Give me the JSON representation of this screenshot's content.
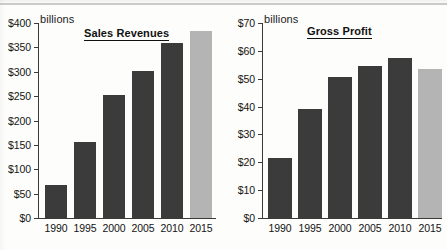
{
  "page": {
    "background_color": "#fdfdfb",
    "bar_dark_color": "#3b3b3b",
    "bar_light_color": "#b4b4b4",
    "axis_color": "#3a3a3a"
  },
  "charts": [
    {
      "id": "sales-revenues",
      "title": "Sales Revenues",
      "units_label": "billions",
      "type": "bar",
      "categories": [
        "1990",
        "1995",
        "2000",
        "2005",
        "2010",
        "2015"
      ],
      "values": [
        68,
        155,
        252,
        301,
        360,
        383
      ],
      "y_ticks": [
        "$0",
        "$50",
        "$100",
        "$150",
        "$200",
        "$250",
        "$300",
        "$350",
        "$400"
      ],
      "y_tick_values": [
        0,
        50,
        100,
        150,
        200,
        250,
        300,
        350,
        400
      ],
      "ylim": [
        0,
        400
      ],
      "xlabel": "",
      "ylabel": "billions",
      "grid": false,
      "legend": "none",
      "bar_shades": [
        "dark",
        "dark",
        "dark",
        "dark",
        "dark",
        "light"
      ]
    },
    {
      "id": "gross-profit",
      "title": "Gross Profit",
      "units_label": "billions",
      "type": "bar",
      "categories": [
        "1990",
        "1995",
        "2000",
        "2005",
        "2010",
        "2015"
      ],
      "values": [
        21.5,
        39,
        50.5,
        54.5,
        57.5,
        53.5
      ],
      "y_ticks": [
        "$0",
        "$10",
        "$20",
        "$30",
        "$40",
        "$50",
        "$60",
        "$70"
      ],
      "y_tick_values": [
        0,
        10,
        20,
        30,
        40,
        50,
        60,
        70
      ],
      "ylim": [
        0,
        70
      ],
      "xlabel": "",
      "ylabel": "billions",
      "grid": false,
      "legend": "none",
      "bar_shades": [
        "dark",
        "dark",
        "dark",
        "dark",
        "dark",
        "light"
      ]
    }
  ],
  "chart_data": [
    {
      "type": "bar",
      "title": "Sales Revenues",
      "categories": [
        "1990",
        "1995",
        "2000",
        "2005",
        "2010",
        "2015"
      ],
      "values": [
        68,
        155,
        252,
        301,
        360,
        383
      ],
      "xlabel": "",
      "ylabel": "billions",
      "ylim": [
        0,
        400
      ],
      "y_tick_labels": [
        "$0",
        "$50",
        "$100",
        "$150",
        "$200",
        "$250",
        "$300",
        "$350",
        "$400"
      ],
      "grid": false,
      "legend": "none"
    },
    {
      "type": "bar",
      "title": "Gross Profit",
      "categories": [
        "1990",
        "1995",
        "2000",
        "2005",
        "2010",
        "2015"
      ],
      "values": [
        21.5,
        39,
        50.5,
        54.5,
        57.5,
        53.5
      ],
      "xlabel": "",
      "ylabel": "billions",
      "ylim": [
        0,
        70
      ],
      "y_tick_labels": [
        "$0",
        "$10",
        "$20",
        "$30",
        "$40",
        "$50",
        "$60",
        "$70"
      ],
      "grid": false,
      "legend": "none"
    }
  ]
}
